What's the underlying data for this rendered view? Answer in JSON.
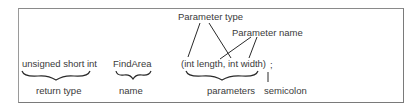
{
  "diagram": {
    "code_parts": {
      "return_type_code": "unsigned short int",
      "name_code": "FindArea",
      "parameters_code": "(int length, int width)",
      "semicolon_code": ";"
    },
    "labels": {
      "return_type": "return type",
      "name": "name",
      "parameters": "parameters",
      "semicolon": "semicolon",
      "parameter_type": "Parameter type",
      "parameter_name": "Parameter name"
    },
    "colors": {
      "text": "#3a3a3a",
      "lines": "#2a2a2a",
      "frame": "#8a8a8a"
    }
  }
}
